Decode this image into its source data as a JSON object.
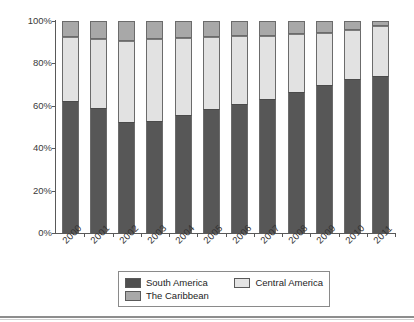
{
  "chart_data": {
    "type": "bar",
    "stacked": true,
    "normalized": true,
    "title": "",
    "xlabel": "",
    "ylabel": "",
    "ylim": [
      0,
      100
    ],
    "ytick_labels": [
      "0%",
      "20%",
      "40%",
      "60%",
      "80%",
      "100%"
    ],
    "ytick_values": [
      0,
      20,
      40,
      60,
      80,
      100
    ],
    "grid": false,
    "legend_position": "bottom",
    "categories": [
      "2000",
      "2001",
      "2002",
      "2003",
      "2004",
      "2005",
      "2006",
      "2007",
      "2008",
      "2009",
      "2010",
      "2011"
    ],
    "series": [
      {
        "name": "South America",
        "color": "#575757",
        "values": [
          62.5,
          59.0,
          52.5,
          53.0,
          55.5,
          58.5,
          61.0,
          63.0,
          66.5,
          70.0,
          72.5,
          74.0
        ]
      },
      {
        "name": "Central America",
        "color": "#e2e2e2",
        "values": [
          30.0,
          32.5,
          38.0,
          38.5,
          36.5,
          34.0,
          32.0,
          30.0,
          27.5,
          24.5,
          23.5,
          23.5
        ]
      },
      {
        "name": "The Caribbean",
        "color": "#a8a8a8",
        "values": [
          7.5,
          8.5,
          9.5,
          8.5,
          8.0,
          7.5,
          7.0,
          7.0,
          6.0,
          5.5,
          4.0,
          2.5
        ]
      }
    ]
  },
  "legend": {
    "items": [
      {
        "label": "South America",
        "swatch": "south-america-swatch"
      },
      {
        "label": "Central America",
        "swatch": "central-america-swatch"
      },
      {
        "label": "The Caribbean",
        "swatch": "the-caribbean-swatch"
      }
    ]
  },
  "colors": {
    "south_america": "#575757",
    "central_america": "#e2e2e2",
    "the_caribbean": "#a8a8a8",
    "axis": "#595959",
    "text": "#333333"
  }
}
